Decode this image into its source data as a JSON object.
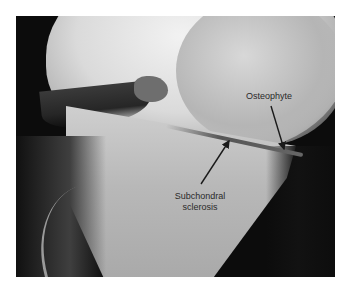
{
  "figure": {
    "annotations": [
      {
        "label": "Osteophyte",
        "arrow_from": [
          271,
          106
        ],
        "arrow_to": [
          284,
          149
        ]
      },
      {
        "label_line1": "Subchondral",
        "label_line2": "sclerosis",
        "arrow_from": [
          201,
          184
        ],
        "arrow_to": [
          229,
          141
        ]
      }
    ]
  },
  "labels": {
    "osteophyte": "Osteophyte",
    "subchondral": "Subchondral",
    "sclerosis": "sclerosis"
  },
  "colors": {
    "background": "#ffffff",
    "xray_dark": "#0c0c0c",
    "label_text": "#2a2a2a",
    "arrow": "#1a1a1a"
  }
}
